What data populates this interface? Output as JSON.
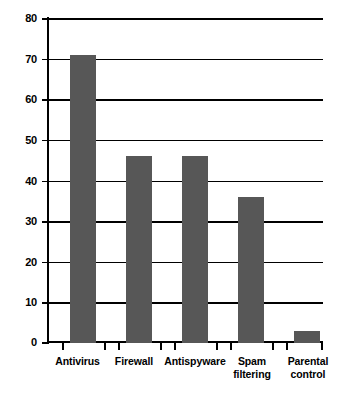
{
  "chart_data": {
    "type": "bar",
    "title": "",
    "subtitle": "",
    "xlabel": "",
    "ylabel": "",
    "categories": [
      "Antivirus",
      "Firewall",
      "Antispyware",
      "Spam\nfiltering",
      "Parental\ncontrol"
    ],
    "values": [
      71,
      46,
      46,
      36,
      3
    ],
    "ylim": [
      0,
      80
    ],
    "ytick_labels": [
      "80",
      "70",
      "60",
      "50",
      "40",
      "30",
      "20",
      "10",
      "0"
    ],
    "ytick_values": [
      80,
      70,
      60,
      50,
      40,
      30,
      20,
      10,
      0
    ],
    "grid": true,
    "legend": null,
    "legend_position": "none",
    "series": [
      {
        "name": "",
        "values": [
          71,
          46,
          46,
          36,
          3
        ]
      }
    ],
    "colors": {
      "bar_fill": "#575757",
      "axis": "#000000",
      "grid": "#000000",
      "background": "#ffffff",
      "text": "#000000"
    }
  }
}
